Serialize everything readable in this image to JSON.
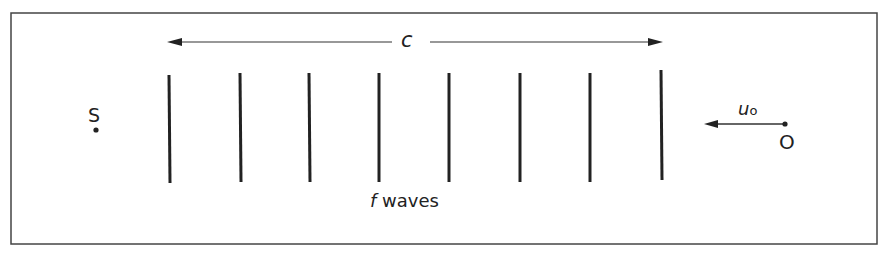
{
  "diagram": {
    "wave_speed_label": "c",
    "source_label": "S",
    "observer_label": "O",
    "observer_velocity_label": "u",
    "observer_velocity_subscript": "o",
    "waves_label_italic": "f",
    "waves_label_text": " waves",
    "wavefront_count": 8,
    "colors": {
      "ink": "#222222",
      "border": "#444444",
      "background": "#ffffff"
    }
  }
}
